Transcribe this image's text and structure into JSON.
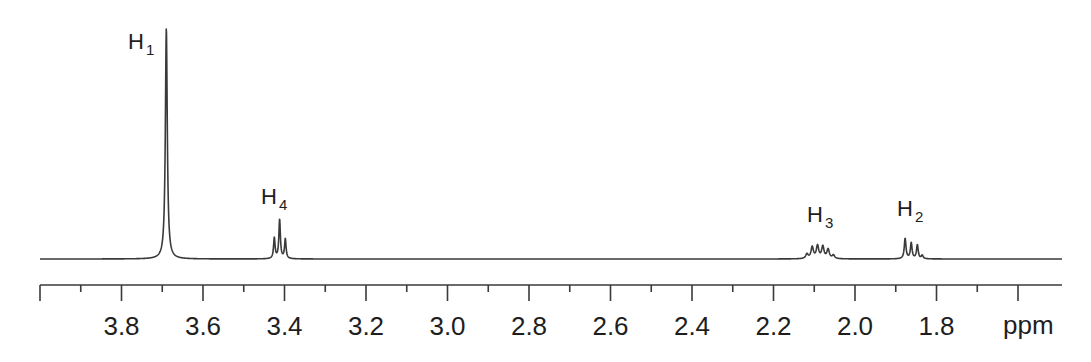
{
  "chart_data": {
    "type": "line",
    "subtype": "1H NMR spectrum",
    "title": "",
    "xlabel": "ppm",
    "ylabel": "",
    "xlim": [
      4.0,
      1.49
    ],
    "x_reversed": true,
    "grid": false,
    "legend": null,
    "x_ticks_major": [
      4.0,
      3.8,
      3.6,
      3.4,
      3.2,
      3.0,
      2.8,
      2.6,
      2.4,
      2.2,
      2.0,
      1.8,
      1.6
    ],
    "x_ticks_minor_step": 0.1,
    "x_tick_labels": [
      "3.8",
      "3.6",
      "3.4",
      "3.2",
      "3.0",
      "2.8",
      "2.6",
      "2.4",
      "2.2",
      "2.0",
      "1.8"
    ],
    "axis_unit_label": "ppm",
    "peaks": [
      {
        "label": "H",
        "sub": "1",
        "shift_ppm": 3.69,
        "multiplicity": "singlet",
        "lines": [
          {
            "ppm": 3.69,
            "height": 1.0
          }
        ],
        "width": 0.0028
      },
      {
        "label": "H",
        "sub": "4",
        "shift_ppm": 3.41,
        "multiplicity": "triplet",
        "lines": [
          {
            "ppm": 3.425,
            "height": 0.09
          },
          {
            "ppm": 3.412,
            "height": 0.17
          },
          {
            "ppm": 3.398,
            "height": 0.085
          }
        ],
        "width": 0.0022
      },
      {
        "label": "H",
        "sub": "3",
        "shift_ppm": 2.09,
        "multiplicity": "multiplet",
        "lines": [
          {
            "ppm": 2.118,
            "height": 0.02
          },
          {
            "ppm": 2.105,
            "height": 0.05
          },
          {
            "ppm": 2.092,
            "height": 0.055
          },
          {
            "ppm": 2.079,
            "height": 0.052
          },
          {
            "ppm": 2.066,
            "height": 0.04
          },
          {
            "ppm": 2.053,
            "height": 0.015
          }
        ],
        "width": 0.0035
      },
      {
        "label": "H",
        "sub": "2",
        "shift_ppm": 1.86,
        "multiplicity": "multiplet",
        "lines": [
          {
            "ppm": 1.877,
            "height": 0.088
          },
          {
            "ppm": 1.862,
            "height": 0.068
          },
          {
            "ppm": 1.847,
            "height": 0.06
          },
          {
            "ppm": 1.835,
            "height": 0.015
          }
        ],
        "width": 0.0025
      }
    ],
    "peak_labels_pos": [
      {
        "id": "H1",
        "x": 128,
        "y": 49
      },
      {
        "id": "H4",
        "x": 261,
        "y": 204
      },
      {
        "id": "H3",
        "x": 807,
        "y": 222
      },
      {
        "id": "H2",
        "x": 897,
        "y": 216
      }
    ],
    "colors": {
      "line": "#3a3a3a",
      "text": "#1e1e1e",
      "background": "#ffffff"
    }
  }
}
